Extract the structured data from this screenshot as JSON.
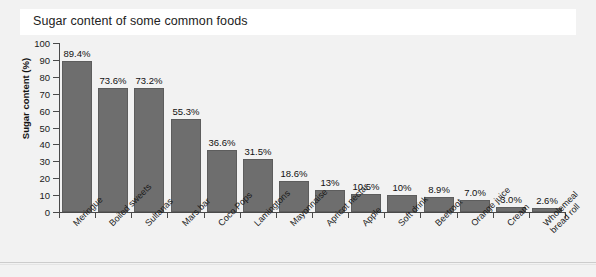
{
  "chart_data": {
    "type": "bar",
    "title": "Sugar content of some common foods",
    "xlabel": "",
    "ylabel": "Sugar content (%)",
    "ylim": [
      0,
      100
    ],
    "ytick_step": 10,
    "grid": false,
    "legend": "none",
    "bar_color": "#6e6e6e",
    "background_color": "#f2f2f2",
    "categories": [
      "Meringue",
      "Boiled sweets",
      "Sultanas",
      "Mars bar",
      "Coco Pops",
      "Lamingtons",
      "Mayonnaise",
      "Apricot nectar",
      "Apple",
      "Soft drink",
      "Beetroot",
      "Orange juice",
      "Cream",
      "Wholemeal bread roll"
    ],
    "category_lines": [
      [
        "Meringue"
      ],
      [
        "Boiled sweets"
      ],
      [
        "Sultanas"
      ],
      [
        "Mars bar"
      ],
      [
        "Coco Pops"
      ],
      [
        "Lamingtons"
      ],
      [
        "Mayonnaise"
      ],
      [
        "Apricot nectar"
      ],
      [
        "Apple"
      ],
      [
        "Soft drink"
      ],
      [
        "Beetroot"
      ],
      [
        "Orange juice"
      ],
      [
        "Cream"
      ],
      [
        "Wholemeal",
        "bread roll"
      ]
    ],
    "values": [
      89.4,
      73.6,
      73.2,
      55.3,
      36.6,
      31.5,
      18.6,
      13,
      10.5,
      10,
      8.9,
      7.0,
      3.0,
      2.6
    ],
    "data_labels": [
      "89.4%",
      "73.6%",
      "73.2%",
      "55.3%",
      "36.6%",
      "31.5%",
      "18.6%",
      "13%",
      "10.5%",
      "10%",
      "8.9%",
      "7.0%",
      "3.0%",
      "2.6%"
    ],
    "ytick_labels": [
      "0",
      "10",
      "20",
      "30",
      "40",
      "50",
      "60",
      "70",
      "80",
      "90",
      "100"
    ],
    "ytick_values": [
      0,
      10,
      20,
      30,
      40,
      50,
      60,
      70,
      80,
      90,
      100
    ]
  }
}
